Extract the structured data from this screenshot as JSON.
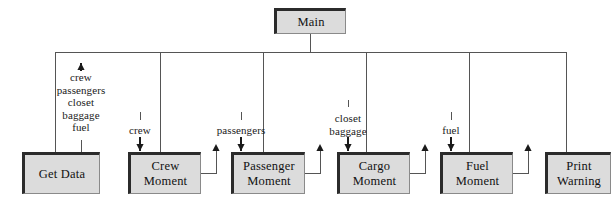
{
  "diagram": {
    "type": "structure-chart",
    "colors": {
      "box_fill": "#dcdcdc",
      "box_shadow": "#2b2b2b",
      "box_border": "#8a8a8a",
      "line": "#555555",
      "text": "#111111",
      "background": "#ffffff"
    },
    "root": {
      "label": "Main",
      "x": 274,
      "y": 8,
      "w": 72,
      "h": 26
    },
    "modules": [
      {
        "id": "get-data",
        "line1": "Get Data",
        "line2": "",
        "x": 22,
        "y": 152,
        "w": 78,
        "h": 42
      },
      {
        "id": "crew-moment",
        "line1": "Crew",
        "line2": "Moment",
        "x": 128,
        "y": 152,
        "w": 73,
        "h": 42
      },
      {
        "id": "passenger-moment",
        "line1": "Passenger",
        "line2": "Moment",
        "x": 231,
        "y": 152,
        "w": 74,
        "h": 42
      },
      {
        "id": "cargo-moment",
        "line1": "Cargo",
        "line2": "Moment",
        "x": 337,
        "y": 152,
        "w": 73,
        "h": 42
      },
      {
        "id": "fuel-moment",
        "line1": "Fuel",
        "line2": "Moment",
        "x": 440,
        "y": 152,
        "w": 73,
        "h": 42
      },
      {
        "id": "print-warning",
        "line1": "Print",
        "line2": "Warning",
        "x": 545,
        "y": 152,
        "w": 66,
        "h": 42
      }
    ],
    "data_couples": [
      {
        "id": "get-data-returns",
        "direction": "up",
        "arrow": "↑",
        "x": 56,
        "y": 71,
        "items": [
          "crew",
          "passengers",
          "closet",
          "baggage",
          "fuel"
        ]
      },
      {
        "id": "crew-in",
        "direction": "down",
        "arrow": "↓",
        "x": 140,
        "y": 125,
        "items": [
          "crew"
        ]
      },
      {
        "id": "passengers-in",
        "direction": "down",
        "arrow": "↓",
        "x": 241,
        "y": 125,
        "items": [
          "passengers"
        ]
      },
      {
        "id": "cargo-in",
        "direction": "down",
        "arrow": "↓",
        "x": 348,
        "y": 112,
        "items": [
          "closet",
          "baggage"
        ]
      },
      {
        "id": "fuel-in",
        "direction": "down",
        "arrow": "↓",
        "x": 451,
        "y": 125,
        "items": [
          "fuel"
        ]
      }
    ],
    "bus": {
      "x1": 55,
      "x2": 566,
      "y": 52
    },
    "return_arrows": [
      {
        "id": "crew-moment-return",
        "box_right": 201,
        "y_box": 173,
        "x_up": 216,
        "y_top": 146
      },
      {
        "id": "passenger-moment-return",
        "box_right": 305,
        "y_box": 173,
        "x_up": 320,
        "y_top": 146
      },
      {
        "id": "cargo-moment-return",
        "box_right": 410,
        "y_box": 173,
        "x_up": 425,
        "y_top": 146
      },
      {
        "id": "fuel-moment-return",
        "box_right": 513,
        "y_box": 173,
        "x_up": 528,
        "y_top": 146
      }
    ]
  }
}
